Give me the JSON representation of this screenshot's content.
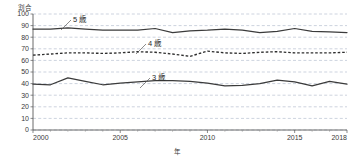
{
  "chart_data": {
    "type": "line",
    "title": "",
    "xlabel": "年",
    "ylabel": "割合",
    "x": [
      2000,
      2001,
      2002,
      2003,
      2004,
      2005,
      2006,
      2007,
      2008,
      2009,
      2010,
      2011,
      2012,
      2013,
      2014,
      2015,
      2016,
      2017,
      2018
    ],
    "xlim": [
      2000,
      2018
    ],
    "ylim": [
      0,
      100
    ],
    "ytick_labels": [
      "0",
      "10",
      "20",
      "30",
      "40",
      "50",
      "60",
      "70",
      "80",
      "90",
      "100"
    ],
    "yticks": [
      0,
      10,
      20,
      30,
      40,
      50,
      60,
      70,
      80,
      90,
      100
    ],
    "xtick_labels": [
      "2000",
      "2005",
      "2010",
      "2015",
      "2018"
    ],
    "xticks": [
      2000,
      2005,
      2010,
      2015,
      2018
    ],
    "grid": true,
    "grid_axis": "y",
    "legend_position": "inline-annotations",
    "series": [
      {
        "name": "5歳",
        "label": "5 歳",
        "style": "solid",
        "color": "#3b3b3b",
        "values": [
          87,
          87,
          88,
          87,
          86,
          86,
          86,
          87.5,
          84,
          85.5,
          86,
          87,
          86,
          84,
          85,
          87.5,
          85,
          84.5,
          84
        ]
      },
      {
        "name": "4歳",
        "label": "4 歳",
        "style": "dashed",
        "color": "#2f2f2f",
        "values": [
          64.5,
          65.5,
          66.5,
          66.5,
          66,
          66.5,
          67.5,
          67,
          65.5,
          63.5,
          68,
          66.5,
          66,
          67,
          67.5,
          66.5,
          66.5,
          66.5,
          67
        ]
      },
      {
        "name": "3歳",
        "label": "3 歳",
        "style": "solid",
        "color": "#3b3b3b",
        "values": [
          39.5,
          39,
          45,
          42,
          39,
          40.5,
          41.5,
          42.5,
          42.5,
          42,
          40.5,
          38,
          38.5,
          40,
          43,
          41.5,
          38,
          42,
          39.5
        ]
      }
    ],
    "annotations": [
      {
        "text": "5 歳",
        "series": "5歳",
        "x_px": 73,
        "y_px": 22,
        "leader_to_x_px": 61,
        "leader_to_y_px": 30
      },
      {
        "text": "4 歳",
        "series": "4歳",
        "x_px": 148,
        "y_px": 46,
        "leader_to_x_px": 136,
        "leader_to_y_px": 54
      },
      {
        "text": "3 歳",
        "series": "3歳",
        "x_px": 152,
        "y_px": 80,
        "leader_to_x_px": 140,
        "leader_to_y_px": 88
      }
    ]
  }
}
